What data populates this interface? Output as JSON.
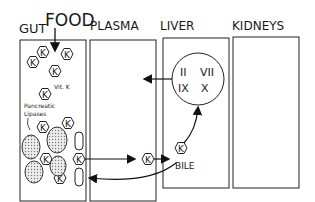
{
  "compartments": {
    "gut": "GUT",
    "food": "FOOD",
    "plasma": "PLASMA",
    "liver": "LIVER",
    "kidneys": "KIDNEYS"
  },
  "gut_labels": {
    "vitk": "Vit. K",
    "pancreatic": "Pancreatic",
    "lipases": "Lipases",
    "lip": "LIP",
    "bile": "BILE"
  },
  "molecule": "K",
  "liver_factors": [
    "II",
    "VII",
    "IX",
    "X"
  ],
  "bile_label": "BILE"
}
